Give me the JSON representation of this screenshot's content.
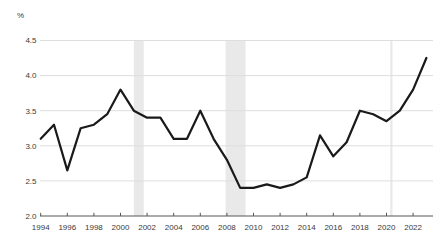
{
  "chart_data": {
    "type": "line",
    "title": "",
    "xlabel": "",
    "ylabel": "%",
    "x": [
      1994,
      1995,
      1996,
      1997,
      1998,
      1999,
      2000,
      2001,
      2002,
      2003,
      2004,
      2005,
      2006,
      2007,
      2008,
      2009,
      2010,
      2011,
      2012,
      2013,
      2014,
      2015,
      2016,
      2017,
      2018,
      2019,
      2020,
      2021,
      2022,
      2023
    ],
    "series": [
      {
        "name": "rate-percent",
        "values": [
          3.1,
          3.3,
          2.65,
          3.25,
          3.3,
          3.45,
          3.8,
          3.5,
          3.4,
          3.4,
          3.1,
          3.1,
          3.5,
          3.1,
          2.8,
          2.4,
          2.4,
          2.45,
          2.4,
          2.45,
          2.55,
          3.15,
          2.85,
          3.05,
          3.5,
          3.45,
          3.35,
          3.5,
          3.8,
          4.25
        ]
      }
    ],
    "ylim": [
      2.0,
      4.5
    ],
    "xlim": [
      1994,
      2023
    ],
    "yticks": [
      "2.0",
      "2.5",
      "3.0",
      "3.5",
      "4.0",
      "4.5"
    ],
    "xticks": [
      1994,
      1996,
      1998,
      2000,
      2002,
      2004,
      2006,
      2008,
      2010,
      2012,
      2014,
      2016,
      2018,
      2020,
      2022
    ],
    "grid": "horizontal",
    "legend": "none",
    "recession_bands": [
      {
        "start": 2001.0,
        "end": 2001.75
      },
      {
        "start": 2007.9,
        "end": 2009.4
      },
      {
        "start": 2020.28,
        "end": 2020.45
      }
    ],
    "colors": {
      "line": "#1a1a1a",
      "grid": "#dedede",
      "axis": "#565656",
      "tick_label": "#3a3a3a",
      "band": "#e9e9e9",
      "background": "#ffffff"
    }
  }
}
